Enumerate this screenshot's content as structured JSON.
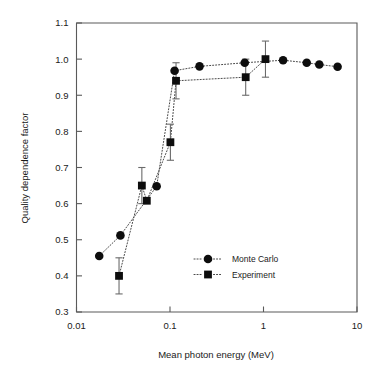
{
  "chart_data": {
    "type": "scatter",
    "title": "",
    "xlabel": "Mean photon energy (MeV)",
    "ylabel": "Quality dependence factor",
    "xscale": "log",
    "yscale": "linear",
    "xlim": [
      0.01,
      10
    ],
    "ylim": [
      0.3,
      1.1
    ],
    "xticks": [
      0.01,
      0.1,
      1,
      10
    ],
    "xtick_labels": [
      "0.01",
      "0.1",
      "1",
      "10"
    ],
    "yticks": [
      0.3,
      0.4,
      0.5,
      0.6,
      0.7,
      0.8,
      0.9,
      1.0,
      1.1
    ],
    "ytick_labels": [
      "0.3",
      "0.4",
      "0.5",
      "0.6",
      "0.7",
      "0.8",
      "0.9",
      "1.0",
      "1.1"
    ],
    "grid": false,
    "legend_position": "lower right",
    "series": [
      {
        "name": "Monte Carlo",
        "marker": "circle",
        "linestyle": "dotted",
        "color": "#0d0d0d",
        "points": [
          {
            "x": 0.0175,
            "y": 0.455
          },
          {
            "x": 0.0295,
            "y": 0.512
          },
          {
            "x": 0.072,
            "y": 0.648
          },
          {
            "x": 0.112,
            "y": 0.968
          },
          {
            "x": 0.207,
            "y": 0.98
          },
          {
            "x": 0.63,
            "y": 0.99
          },
          {
            "x": 1.62,
            "y": 0.997
          },
          {
            "x": 2.9,
            "y": 0.99
          },
          {
            "x": 3.95,
            "y": 0.985
          },
          {
            "x": 6.2,
            "y": 0.979
          }
        ]
      },
      {
        "name": "Experiment",
        "marker": "square",
        "linestyle": "dotted",
        "color": "#0d0d0d",
        "points": [
          {
            "x": 0.0285,
            "y": 0.4,
            "yerr": 0.05
          },
          {
            "x": 0.05,
            "y": 0.65,
            "yerr": 0.05
          },
          {
            "x": 0.0565,
            "y": 0.608,
            "yerr": 0.0
          },
          {
            "x": 0.101,
            "y": 0.77,
            "yerr": 0.05
          },
          {
            "x": 0.116,
            "y": 0.94,
            "yerr": 0.05
          },
          {
            "x": 0.645,
            "y": 0.95,
            "yerr": 0.05
          },
          {
            "x": 1.05,
            "y": 1.0,
            "yerr": 0.05
          }
        ]
      }
    ]
  },
  "legend": {
    "entries": [
      {
        "label": "Monte Carlo",
        "marker": "circle"
      },
      {
        "label": "Experiment",
        "marker": "square"
      }
    ]
  },
  "icons": {
    "circle_marker": "filled-circle-marker",
    "square_marker": "filled-square-marker"
  }
}
